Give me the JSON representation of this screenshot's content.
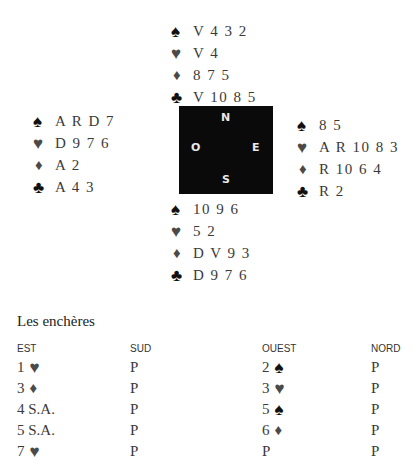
{
  "suits": {
    "spade": "♠",
    "heart": "♥",
    "diamond": "♦",
    "club": "♣"
  },
  "hands": {
    "north": {
      "spades": "V 4 3 2",
      "hearts": "V 4",
      "diamonds": "8 7 5",
      "clubs": "V 10 8 5"
    },
    "west": {
      "spades": "A R D 7",
      "hearts": "D 9 7 6",
      "diamonds": "A 2",
      "clubs": "A 4 3"
    },
    "east": {
      "spades": "8 5",
      "hearts": "A R 10 8 3",
      "diamonds": "R 10 6 4",
      "clubs": "R 2"
    },
    "south": {
      "spades": "10 9 6",
      "hearts": "5 2",
      "diamonds": "D V 9 3",
      "clubs": "D 9 7 6"
    }
  },
  "compass": {
    "north": "N",
    "west": "O",
    "east": "E",
    "south": "S"
  },
  "bidding": {
    "title": "Les enchères",
    "headers": [
      "EST",
      "SUD",
      "OUEST",
      "NORD"
    ],
    "rows": [
      [
        {
          "level": "1",
          "suit": "♥"
        },
        {
          "level": "P",
          "suit": ""
        },
        {
          "level": "2",
          "suit": "♠"
        },
        {
          "level": "P",
          "suit": ""
        }
      ],
      [
        {
          "level": "3",
          "suit": "♦"
        },
        {
          "level": "P",
          "suit": ""
        },
        {
          "level": "3",
          "suit": "♥"
        },
        {
          "level": "P",
          "suit": ""
        }
      ],
      [
        {
          "level": "4 S.A.",
          "suit": ""
        },
        {
          "level": "P",
          "suit": ""
        },
        {
          "level": "5",
          "suit": "♠"
        },
        {
          "level": "P",
          "suit": ""
        }
      ],
      [
        {
          "level": "5 S.A.",
          "suit": ""
        },
        {
          "level": "P",
          "suit": ""
        },
        {
          "level": "6",
          "suit": "♦"
        },
        {
          "level": "P",
          "suit": ""
        }
      ],
      [
        {
          "level": "7",
          "suit": "♥"
        },
        {
          "level": "P",
          "suit": ""
        },
        {
          "level": "P",
          "suit": ""
        },
        {
          "level": "P",
          "suit": ""
        }
      ]
    ]
  }
}
